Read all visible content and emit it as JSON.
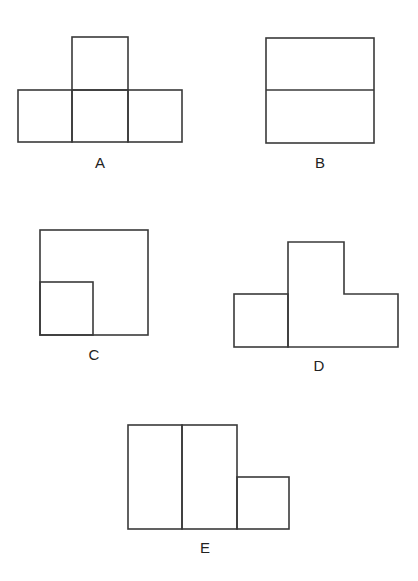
{
  "figures": [
    {
      "label": "A",
      "description": "T-shape: one square on top of a row of three squares"
    },
    {
      "label": "B",
      "description": "Square divided horizontally into two rectangles"
    },
    {
      "label": "C",
      "description": "Large square with a small square in the lower-left corner"
    },
    {
      "label": "D",
      "description": "Square on left adjoining an L-shaped piece on the right"
    },
    {
      "label": "E",
      "description": "Two tall rectangles side by side with a small square at lower right"
    }
  ],
  "colors": {
    "stroke": "#3a3a3a",
    "background": "#ffffff"
  }
}
